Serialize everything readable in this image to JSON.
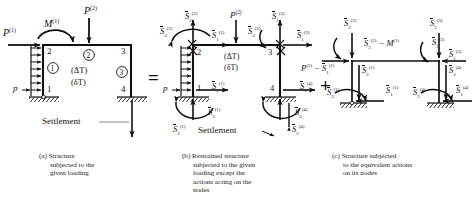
{
  "figure": {
    "equals_symbol": "=",
    "plus_symbol": "+"
  },
  "panel_a": {
    "caption_line1": "(a)  Structure",
    "caption_line2": "subjected to the",
    "caption_line3": "given loading",
    "loads": {
      "p1": "P",
      "p1_sup": "(1)",
      "m1": "M",
      "m1_sup": "(1)",
      "p2": "P",
      "p2_sup": "(2)",
      "p_dist": "p",
      "settlement": "Settlement"
    },
    "nodes": [
      "1",
      "2",
      "3",
      "4"
    ],
    "members": [
      "1",
      "2",
      "3"
    ],
    "thermal": [
      "(ΔT)",
      "(δT)"
    ]
  },
  "panel_b": {
    "caption_line1": "(b)  Restrained structure",
    "caption_line2": "subjected to the given",
    "caption_line3": "loading except the",
    "caption_line4": "actions acting on the",
    "caption_line5": "nodes",
    "nodes": [
      "1",
      "2",
      "3",
      "4"
    ],
    "thermal": [
      "(ΔT)",
      "(δT)"
    ],
    "p_dist": "p",
    "p2": "P",
    "p2_sup": "(2)",
    "settlement": "Settlement",
    "forces": [
      {
        "sym": "S",
        "sub": "2",
        "sup": "(2)"
      },
      {
        "sym": "S",
        "sub": "3",
        "sup": "(2)"
      },
      {
        "sym": "S",
        "sub": "1",
        "sup": "(2)"
      },
      {
        "sym": "S",
        "sub": "2",
        "sup": "(3)"
      },
      {
        "sym": "S",
        "sub": "3",
        "sup": "(3)"
      },
      {
        "sym": "S",
        "sub": "1",
        "sup": "(3)"
      },
      {
        "sym": "S",
        "sub": "1",
        "sup": "(1)"
      },
      {
        "sym": "S",
        "sub": "3",
        "sup": "(1)"
      },
      {
        "sym": "S",
        "sub": "2",
        "sup": "(1)"
      },
      {
        "sym": "S",
        "sub": "1",
        "sup": "(4)"
      },
      {
        "sym": "S",
        "sub": "3",
        "sup": "(4)"
      },
      {
        "sym": "S",
        "sub": "2",
        "sup": "(4)"
      }
    ]
  },
  "panel_c": {
    "caption_line1": "(c)  Structure subjected",
    "caption_line2": "to the equivalent actions",
    "caption_line3": "on its nodes",
    "forces": [
      {
        "sym": "S",
        "sub": "2",
        "sup": "(2)"
      },
      {
        "sym": "S",
        "sub": "3",
        "sup": "(2)"
      },
      {
        "sym": "S",
        "sub": "1",
        "sup": "(2)"
      },
      {
        "sym": "S",
        "sub": "2",
        "sup": "(3)"
      },
      {
        "sym": "S",
        "sub": "3",
        "sup": "(3)"
      },
      {
        "sym": "S",
        "sub": "1",
        "sup": "(3)"
      },
      {
        "sym": "S",
        "sub": "1",
        "sup": "(1)"
      },
      {
        "sym": "S",
        "sub": "2",
        "sup": "(1)"
      },
      {
        "sym": "S",
        "sub": "3",
        "sup": "(1)"
      },
      {
        "sym": "S",
        "sub": "1",
        "sup": "(4)"
      },
      {
        "sym": "S",
        "sub": "2",
        "sup": "(4)"
      },
      {
        "sym": "S",
        "sub": "3",
        "sup": "(4)"
      }
    ],
    "expr_moment_pre": "S",
    "expr_moment_sub": "3",
    "expr_moment_sup": "(2)",
    "expr_moment_op": " − M",
    "expr_moment_msup": "(1)",
    "expr_horiz_pre": "P",
    "expr_horiz_psup": "(1)",
    "expr_horiz_op": " − ",
    "expr_horiz_sym": "S",
    "expr_horiz_sub": "1",
    "expr_horiz_sup": "(2)"
  },
  "colors": {
    "ink": "#111111",
    "hatch": "#111111"
  }
}
